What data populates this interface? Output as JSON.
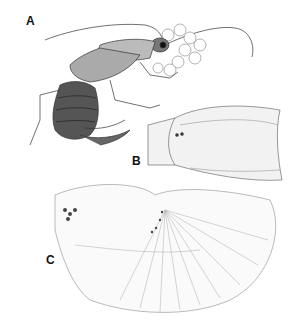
{
  "figure": {
    "panels": [
      {
        "label": "A",
        "description": "earwig-lateral-view"
      },
      {
        "label": "B",
        "description": "forewing-tegmen"
      },
      {
        "label": "C",
        "description": "hindwing-unfolded"
      }
    ]
  }
}
